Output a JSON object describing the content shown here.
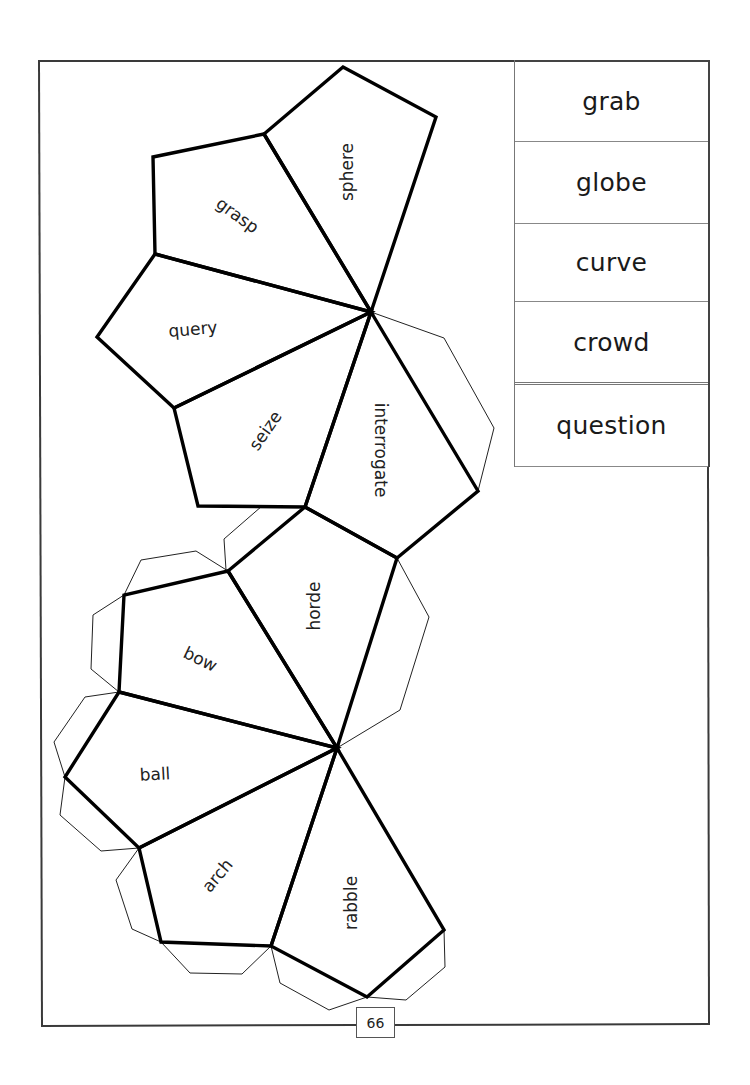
{
  "page": {
    "page_number": "66"
  },
  "word_list": {
    "items": [
      {
        "label": "grab"
      },
      {
        "label": "globe"
      },
      {
        "label": "curve"
      },
      {
        "label": "crowd"
      },
      {
        "label": "question"
      }
    ]
  },
  "net": {
    "faces": [
      {
        "label": "sphere"
      },
      {
        "label": "grasp"
      },
      {
        "label": "query"
      },
      {
        "label": "seize"
      },
      {
        "label": "interrogate"
      },
      {
        "label": "horde"
      },
      {
        "label": "bow"
      },
      {
        "label": "ball"
      },
      {
        "label": "arch"
      },
      {
        "label": "rabble"
      }
    ]
  },
  "colors": {
    "line": "#000000",
    "frame": "#3a3a3a",
    "background": "#ffffff"
  }
}
